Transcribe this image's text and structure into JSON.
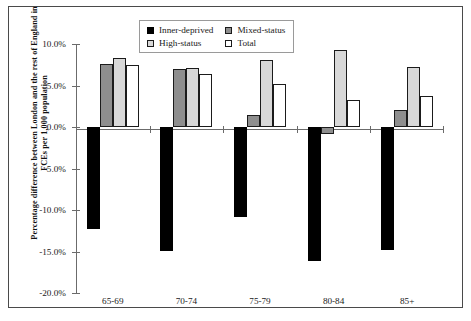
{
  "chart_data": {
    "type": "bar",
    "title": "",
    "subtitle": "",
    "xlabel": "",
    "ylabel": "Percentage difference between London and the rest of England in FCEs per 1,000 population",
    "categories": [
      "65-69",
      "70-74",
      "75-79",
      "80-84",
      "85+"
    ],
    "series": [
      {
        "name": "Inner-deprived",
        "color": "#000000",
        "values": [
          -12.3,
          -14.9,
          -10.8,
          -16.1,
          -14.8
        ]
      },
      {
        "name": "Mixed-status",
        "color": "#8e8e8e",
        "values": [
          7.6,
          7.0,
          1.4,
          -0.8,
          2.0
        ]
      },
      {
        "name": "High-status",
        "color": "#d8d8d8",
        "values": [
          8.3,
          7.1,
          8.1,
          9.3,
          7.2
        ]
      },
      {
        "name": "Total",
        "color": "#ffffff",
        "values": [
          7.5,
          6.4,
          5.2,
          3.2,
          3.7
        ]
      }
    ],
    "ylim": [
      -20.0,
      10.0
    ],
    "yticks": [
      10.0,
      5.0,
      0.0,
      -5.0,
      -10.0,
      -15.0,
      -20.0
    ],
    "ytick_labels": [
      "10.0%",
      "5.0%",
      "0.0%",
      "-5.0%",
      "-10.0%",
      "-15.0%",
      "-20.0%"
    ],
    "grid": false,
    "legend_position": "top-center",
    "legend_entries": [
      "Inner-deprived",
      "Mixed-status",
      "High-status",
      "Total"
    ]
  }
}
